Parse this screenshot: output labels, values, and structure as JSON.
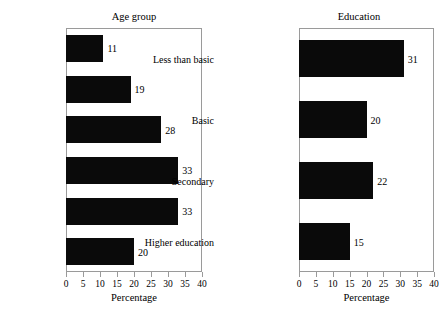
{
  "chart_data": [
    {
      "type": "bar",
      "orientation": "horizontal",
      "title": "Age group",
      "xlabel": "Percentage",
      "ylabel": "",
      "categories": [
        "Ages 15–19",
        "Ages 20–29",
        "Ages 30–39",
        "Ages 40–49",
        "Ages 50–59",
        "Ages 60–64"
      ],
      "values": [
        11,
        19,
        28,
        33,
        33,
        20
      ],
      "data_labels": [
        "11",
        "19",
        "28",
        "33",
        "33",
        "20"
      ],
      "xlim": [
        0,
        40
      ],
      "xticks": [
        0,
        5,
        10,
        15,
        20,
        25,
        30,
        35,
        40
      ],
      "xtick_labels": [
        "0",
        "5",
        "10",
        "15",
        "20",
        "25",
        "30",
        "35",
        "40"
      ],
      "grid": false,
      "legend": false,
      "bar_color": "#0a0a0a",
      "frame_color": "#9a9a9a"
    },
    {
      "type": "bar",
      "orientation": "horizontal",
      "title": "Education",
      "xlabel": "Percentage",
      "ylabel": "",
      "categories": [
        "Less than basic",
        "Basic",
        "Secondary",
        "Higher education"
      ],
      "values": [
        31,
        20,
        22,
        15
      ],
      "data_labels": [
        "31",
        "20",
        "22",
        "15"
      ],
      "xlim": [
        0,
        40
      ],
      "xticks": [
        0,
        5,
        10,
        15,
        20,
        25,
        30,
        35,
        40
      ],
      "xtick_labels": [
        "0",
        "5",
        "10",
        "15",
        "20",
        "25",
        "30",
        "35",
        "40"
      ],
      "grid": false,
      "legend": false,
      "bar_color": "#0a0a0a",
      "frame_color": "#9a9a9a"
    }
  ]
}
